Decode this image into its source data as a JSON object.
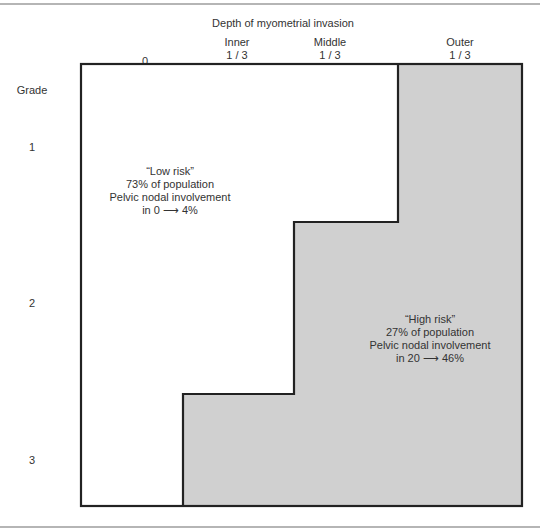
{
  "diagram": {
    "title": "Depth of myometrial invasion",
    "columns": [
      {
        "line1": "",
        "line2": "0"
      },
      {
        "line1": "Inner",
        "line2": "1 / 3"
      },
      {
        "line1": "Middle",
        "line2": "1 / 3"
      },
      {
        "line1": "Outer",
        "line2": "1 / 3"
      }
    ],
    "row_header": "Grade",
    "rows": [
      "1",
      "2",
      "3"
    ],
    "regions": {
      "low_risk": {
        "label": "“Low risk”",
        "population": "73% of population",
        "nodal": "Pelvic nodal involvement",
        "range": "in 0 ⟶ 4%",
        "fill": "#ffffff"
      },
      "high_risk": {
        "label": "“High risk”",
        "population": "27% of population",
        "nodal": "Pelvic nodal involvement",
        "range": "in 20 ⟶ 46%",
        "fill": "#d0d0d0"
      }
    },
    "border_color": "#222222"
  }
}
